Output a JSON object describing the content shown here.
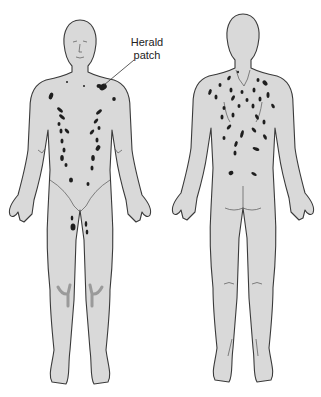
{
  "diagram": {
    "views": [
      {
        "name": "front",
        "label": ""
      },
      {
        "name": "back",
        "label": ""
      }
    ],
    "annotations": [
      {
        "id": "herald",
        "line1": "Herald",
        "line2": "patch",
        "points_to": "left upper chest near shoulder (front view)"
      }
    ],
    "colors": {
      "background": "#ffffff",
      "skin": "#d9d9d9",
      "outline": "#3a3a3a",
      "lesion": "#1e1e1e",
      "shadow": "#9a9a9a"
    }
  }
}
